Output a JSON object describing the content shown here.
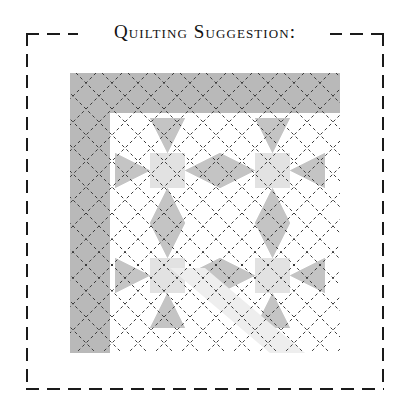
{
  "page": {
    "title": "Quilting Suggestion:",
    "background_color": "#ffffff"
  },
  "frame": {
    "name": "dashed-border-frame",
    "stroke_color": "#1a1a1a",
    "dash_pattern": "13 8",
    "x": 26,
    "y": 33,
    "width": 358,
    "height": 357
  },
  "quilt": {
    "name": "quilt-block-diagram",
    "x": 70,
    "y": 73,
    "width": 270,
    "height": 280,
    "colors": {
      "background": "#ffffff",
      "border_fabric": "#b9b9b9",
      "medium_gray": "#c4c4c4",
      "light_gray": "#e2e2e2",
      "pale_gray": "#eeeeee",
      "quilting_line": "#3a3a3a"
    },
    "border": {
      "label": "Border fabric",
      "top_height": 40,
      "left_width": 40,
      "shade": "#b9b9b9"
    },
    "blocks": {
      "label": "Star blocks",
      "rows": 2,
      "cols": 2,
      "cell_size": 105,
      "unit": "nine-patch star",
      "point_color": "#c4c4c4",
      "center_color": "#e2e2e2"
    },
    "quilting_lines": {
      "label": "Diagonal cross-hatch quilting",
      "style": "dashed",
      "angle_degrees": 45,
      "spacing": 26,
      "color": "#3a3a3a",
      "dash": "3 3"
    }
  }
}
